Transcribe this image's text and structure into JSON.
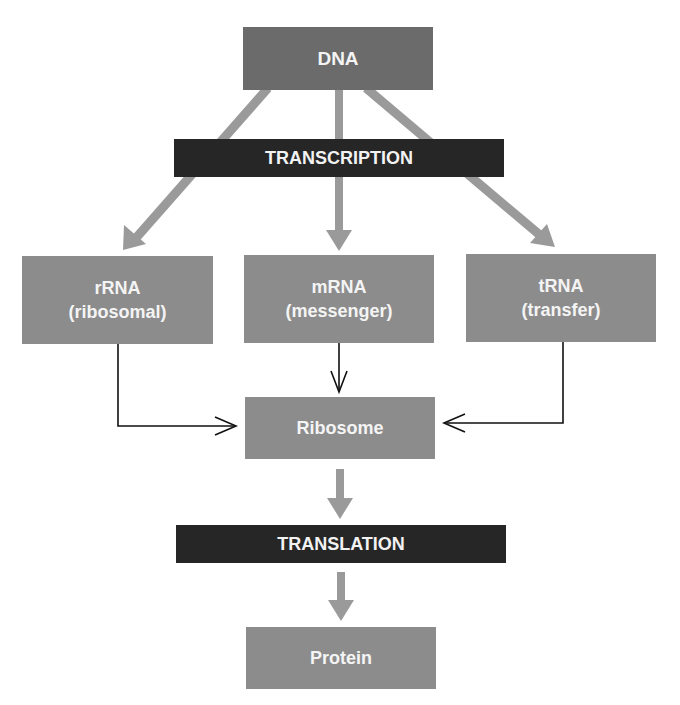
{
  "diagram": {
    "type": "flowchart",
    "title": "",
    "colors": {
      "source_box": "#6b6b6b",
      "node_box": "#8c8c8c",
      "process_bar": "#262626",
      "thick_arrow": "#999999",
      "thin_arrow": "#111111",
      "text": "#f4f4f4"
    },
    "nodes": {
      "dna": {
        "label": "DNA"
      },
      "transcription": {
        "label": "TRANSCRIPTION"
      },
      "rrna": {
        "line1": "rRNA",
        "line2": "(ribosomal)"
      },
      "mrna": {
        "line1": "mRNA",
        "line2": "(messenger)"
      },
      "trna": {
        "line1": "tRNA",
        "line2": "(transfer)"
      },
      "ribosome": {
        "label": "Ribosome"
      },
      "translation": {
        "label": "TRANSLATION"
      },
      "protein": {
        "label": "Protein"
      }
    },
    "edges": [
      {
        "from": "DNA",
        "to": "rRNA",
        "via": "TRANSCRIPTION",
        "style": "thick-gray"
      },
      {
        "from": "DNA",
        "to": "mRNA",
        "via": "TRANSCRIPTION",
        "style": "thick-gray"
      },
      {
        "from": "DNA",
        "to": "tRNA",
        "via": "TRANSCRIPTION",
        "style": "thick-gray"
      },
      {
        "from": "rRNA",
        "to": "Ribosome",
        "style": "thin-black-elbow"
      },
      {
        "from": "mRNA",
        "to": "Ribosome",
        "style": "thin-black"
      },
      {
        "from": "tRNA",
        "to": "Ribosome",
        "style": "thin-black-elbow"
      },
      {
        "from": "Ribosome",
        "to": "TRANSLATION",
        "style": "thick-gray"
      },
      {
        "from": "TRANSLATION",
        "to": "Protein",
        "style": "thick-gray"
      }
    ]
  }
}
